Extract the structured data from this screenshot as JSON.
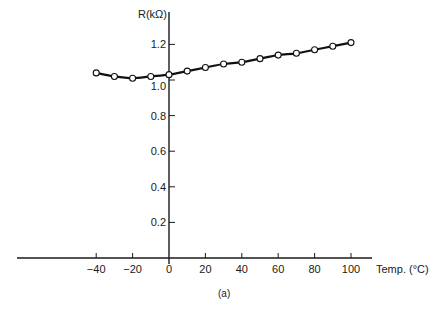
{
  "chart_data": {
    "type": "line",
    "title": "",
    "caption": "(a)",
    "xlabel": "Temp. (°C)",
    "ylabel": "R(kΩ)",
    "xlim": [
      -40,
      100
    ],
    "ylim": [
      0,
      1.2
    ],
    "grid": false,
    "legend": null,
    "x_ticks": [
      -40,
      -20,
      0,
      20,
      40,
      60,
      80,
      100
    ],
    "x_tick_labels": [
      "−40",
      "−20",
      "0",
      "20",
      "40",
      "60",
      "80",
      "100"
    ],
    "y_ticks": [
      0.2,
      0.4,
      0.6,
      0.8,
      1.0,
      1.2
    ],
    "y_tick_labels": [
      "0.2",
      "0.4",
      "0.6",
      "0.8",
      "1.0",
      "1.2"
    ],
    "x": [
      -40,
      -30,
      -20,
      -10,
      0,
      10,
      20,
      30,
      40,
      50,
      60,
      70,
      80,
      90,
      100
    ],
    "series": [
      {
        "name": "R",
        "marker": "open-circle",
        "values": [
          1.04,
          1.02,
          1.01,
          1.02,
          1.03,
          1.05,
          1.07,
          1.09,
          1.1,
          1.12,
          1.14,
          1.15,
          1.17,
          1.19,
          1.21
        ]
      }
    ]
  }
}
